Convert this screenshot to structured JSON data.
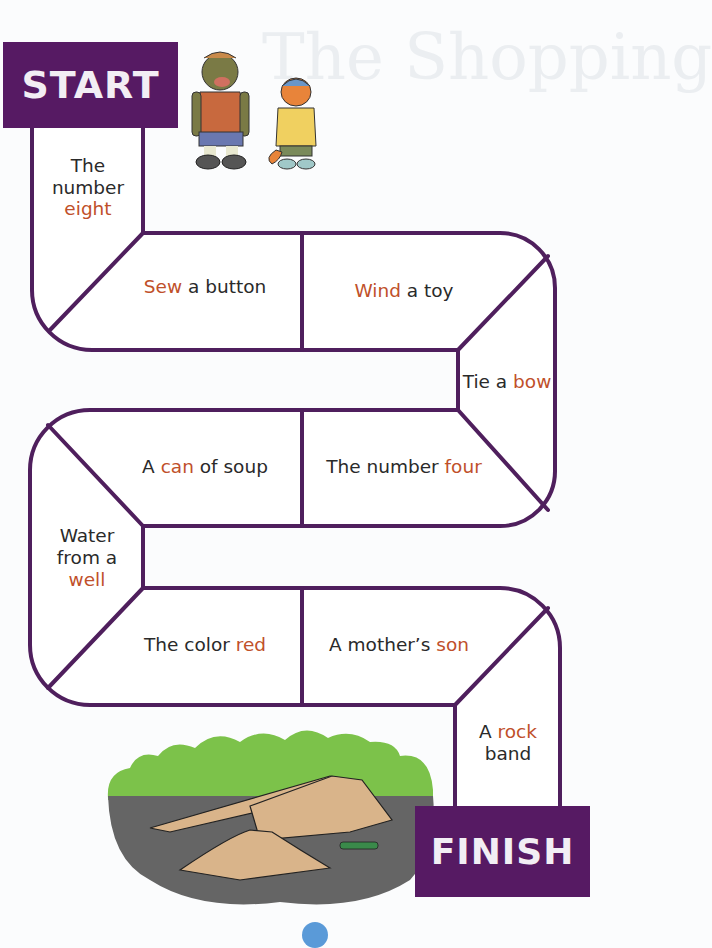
{
  "board": {
    "start_label": "START",
    "finish_label": "FINISH",
    "colors": {
      "path_line": "#4f1f5d",
      "sign_bg": "#561a63",
      "sign_text": "#f2eef4",
      "keyword": "#c0502a",
      "text": "#2a2a2a"
    },
    "spaces": [
      {
        "id": 1,
        "before": "The number",
        "keyword": "eight",
        "after": ""
      },
      {
        "id": 2,
        "before": "",
        "keyword": "Sew",
        "after": " a button"
      },
      {
        "id": 3,
        "before": "",
        "keyword": "Wind",
        "after": " a toy"
      },
      {
        "id": 4,
        "before": "Tie a ",
        "keyword": "bow",
        "after": ""
      },
      {
        "id": 5,
        "before": "The number ",
        "keyword": "four",
        "after": ""
      },
      {
        "id": 6,
        "before": "A ",
        "keyword": "can",
        "after": " of soup"
      },
      {
        "id": 7,
        "before": "Water from a",
        "keyword": "well",
        "after": ""
      },
      {
        "id": 8,
        "before": "The color ",
        "keyword": "red",
        "after": ""
      },
      {
        "id": 9,
        "before": "A mother’s ",
        "keyword": "son",
        "after": ""
      },
      {
        "id": 10,
        "before": "A ",
        "keyword": "rock",
        "after": " band"
      }
    ]
  },
  "cells": {
    "s1": {
      "l1": "The",
      "l2": "number",
      "kw": "eight"
    },
    "s2": {
      "kw": "Sew",
      "rest": " a button"
    },
    "s3": {
      "kw": "Wind",
      "rest": " a toy"
    },
    "s4": {
      "pre": "Tie a ",
      "kw": "bow"
    },
    "s5": {
      "pre": "The number ",
      "kw": "four"
    },
    "s6": {
      "pre": "A ",
      "kw": "can",
      "rest": " of soup"
    },
    "s7": {
      "l1": "Water",
      "l2": "from a",
      "kw": "well"
    },
    "s8": {
      "pre": "The color ",
      "kw": "red"
    },
    "s9": {
      "pre": "A mother’s ",
      "kw": "son"
    },
    "s10": {
      "pre": "A ",
      "kw": "rock",
      "l2": "band"
    }
  },
  "illustrations": {
    "characters": "bear-and-fox-characters",
    "skatepark": "skate-ramp-scene"
  }
}
